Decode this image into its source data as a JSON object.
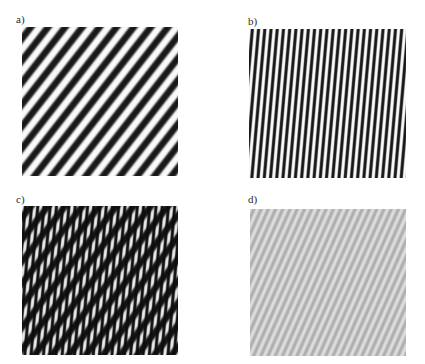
{
  "figure": {
    "caption_style": "panel-letters",
    "background_color": "#ffffff",
    "width": 425,
    "height": 364,
    "panels": [
      {
        "id": "a",
        "label": "a)",
        "description": "sinusoidal grating, diagonal stripes ascending left-to-right",
        "pattern": "grating",
        "angle_deg": 52,
        "period_px": 13.5,
        "contrast": 1.0,
        "dark_color": "#141414",
        "light_color": "#ffffff",
        "mean_level": 0.5
      },
      {
        "id": "b",
        "label": "b)",
        "description": "sinusoidal grating, near-vertical stripes tilted slightly right",
        "pattern": "grating",
        "angle_deg": 85,
        "period_px": 6.2,
        "contrast": 1.0,
        "dark_color": "#141414",
        "light_color": "#ffffff",
        "mean_level": 0.5
      },
      {
        "id": "c",
        "label": "c)",
        "description": "multiplicative superposition of gratings a and b, dark moire interference",
        "pattern": "grating-product",
        "angle_deg": 52,
        "angle2_deg": 85,
        "period_px": 13.5,
        "period2_px": 6.2,
        "contrast": 1.0,
        "dark_color": "#0d0d0d",
        "light_color": "#f2f2f2",
        "mean_level": 0.27
      },
      {
        "id": "d",
        "label": "d)",
        "description": "fine low-contrast grating, light gray diagonal stripes",
        "pattern": "grating",
        "angle_deg": 66,
        "period_px": 6.6,
        "contrast": 0.42,
        "dark_color": "#8f8f8f",
        "light_color": "#fdfdfd",
        "mean_level": 0.78
      }
    ]
  },
  "chart_data": {
    "type": "heatmap",
    "title": "",
    "subtitle": "",
    "xlabel": "",
    "ylabel": "",
    "grid": false,
    "legend": "none",
    "panel_labels": [
      "a)",
      "b)",
      "c)",
      "d)"
    ],
    "series": [
      {
        "name": "a)",
        "pattern": "sinusoidal grating",
        "orientation_deg": 52,
        "spatial_period_px": 13.5,
        "michelson_contrast": 1.0,
        "mean_luminance": 0.5,
        "cycles_across_panel": 17
      },
      {
        "name": "b)",
        "pattern": "sinusoidal grating",
        "orientation_deg": 85,
        "spatial_period_px": 6.2,
        "michelson_contrast": 1.0,
        "mean_luminance": 0.5,
        "cycles_across_panel": 25
      },
      {
        "name": "c)",
        "pattern": "product of gratings a and b",
        "orientation_deg": [
          52,
          85
        ],
        "spatial_period_px": [
          13.5,
          6.2
        ],
        "michelson_contrast": 1.0,
        "mean_luminance": 0.27,
        "cycles_across_panel": [
          17,
          25
        ]
      },
      {
        "name": "d)",
        "pattern": "sinusoidal grating",
        "orientation_deg": 66,
        "spatial_period_px": 6.6,
        "michelson_contrast": 0.42,
        "mean_luminance": 0.78,
        "cycles_across_panel": 24
      }
    ]
  }
}
